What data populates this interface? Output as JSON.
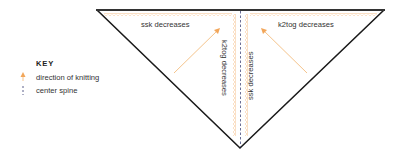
{
  "diagram": {
    "type": "knitting-shawl-construction",
    "colors": {
      "outline": "#1a1a1a",
      "accent": "#f2a65a",
      "spine": "#5a5f8a",
      "text": "#333333"
    },
    "regions": {
      "top_left_label": "ssk decreases",
      "top_right_label": "k2tog decreases",
      "spine_left_label": "k2tog decreases",
      "spine_right_label": "ssk decreases"
    }
  },
  "key": {
    "title": "KEY",
    "items": [
      {
        "icon": "arrow-up-icon",
        "label": "direction of knitting"
      },
      {
        "icon": "dashed-line-icon",
        "label": "center spine"
      }
    ]
  }
}
